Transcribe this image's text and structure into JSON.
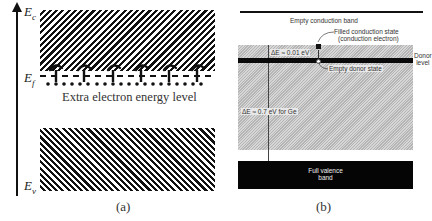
{
  "panel_a": {
    "caption": "(a)",
    "axis": {
      "direction": "up",
      "label": "Energy"
    },
    "levels": {
      "conduction": {
        "symbol": "E",
        "subscript": "c"
      },
      "fermi": {
        "symbol": "E",
        "subscript": "f"
      },
      "valence": {
        "symbol": "E",
        "subscript": "v"
      }
    },
    "extra_level_label": "Extra electron energy level",
    "donor_count": 6
  },
  "panel_b": {
    "caption": "(b)",
    "empty_conduction_band": "Empty conduction band",
    "filled_state_line1": "Filled conduction state",
    "filled_state_line2": "(conduction electron)",
    "donor_level_line1": "Donor",
    "donor_level_line2": "level",
    "empty_donor_state": "Empty donor state",
    "delta_e_small": "ΔE ≈ 0.01 eV",
    "delta_e_gap": "ΔE ≈ 0.7 eV for Ge",
    "valence_line1": "Full valence",
    "valence_line2": "band"
  },
  "colors": {
    "ink": "#111111",
    "gap_fill": "#c6c6c6",
    "background": "#ffffff"
  }
}
